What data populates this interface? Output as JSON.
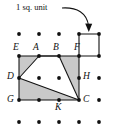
{
  "figure": {
    "title_annotation": "1 sq. unit",
    "background_color": "#ffffff",
    "ink_color": "#111111",
    "shade_color": "#c9c9c9",
    "dot_color": "#111111",
    "grid": {
      "columns": 5,
      "rows": 5,
      "x_positions": [
        19,
        39,
        59,
        79,
        99
      ],
      "y_positions": [
        34,
        56,
        78,
        100,
        122
      ],
      "dot_radius": 1.9
    },
    "unit_square": {
      "label": "1 sq. unit",
      "corners": [
        [
          79,
          34
        ],
        [
          99,
          34
        ],
        [
          99,
          56
        ],
        [
          79,
          56
        ]
      ]
    },
    "arrow": {
      "name": "curved-arrow",
      "path": "M 62 8 C 76 8, 86 14, 88 27",
      "head": "M 88 32 L 84.6 24.6 L 91.4 24.6 Z"
    },
    "outer_region": {
      "name": "shaded-rectangle-EFCG",
      "points": "19,56 79,56 79,100 19,100"
    },
    "inner_region": {
      "name": "white-quadrilateral-DABC",
      "points": "19,78 39,56 59,56 79,100"
    },
    "segments": [
      {
        "name": "segment-E-F",
        "from": "E",
        "to": "F"
      },
      {
        "name": "segment-E-D",
        "from": "E",
        "to": "D"
      },
      {
        "name": "segment-D-G",
        "from": "D",
        "to": "G"
      },
      {
        "name": "segment-G-C",
        "from": "G",
        "to": "C"
      },
      {
        "name": "segment-C-F",
        "from": "C",
        "to": "F"
      },
      {
        "name": "segment-D-A",
        "from": "D",
        "to": "A"
      },
      {
        "name": "segment-A-B",
        "from": "A",
        "to": "B"
      },
      {
        "name": "segment-B-C",
        "from": "B",
        "to": "C"
      },
      {
        "name": "segment-D-C",
        "from": "D",
        "to": "C"
      }
    ],
    "labeled_points": [
      {
        "id": "E",
        "label": "E",
        "x": 19,
        "y": 56,
        "label_x": 13,
        "label_y": 44
      },
      {
        "id": "A",
        "label": "A",
        "x": 39,
        "y": 56,
        "label_x": 33,
        "label_y": 44
      },
      {
        "id": "B",
        "label": "B",
        "x": 59,
        "y": 56,
        "label_x": 54,
        "label_y": 44
      },
      {
        "id": "F",
        "label": "F",
        "x": 79,
        "y": 56,
        "label_x": 74,
        "label_y": 44
      },
      {
        "id": "D",
        "label": "D",
        "x": 19,
        "y": 78,
        "label_x": 8,
        "label_y": 73
      },
      {
        "id": "H",
        "label": "H",
        "x": 79,
        "y": 78,
        "label_x": 83,
        "label_y": 73
      },
      {
        "id": "G",
        "label": "G",
        "x": 19,
        "y": 100,
        "label_x": 8,
        "label_y": 95
      },
      {
        "id": "K",
        "label": "K",
        "x": 59,
        "y": 100,
        "label_x": 55,
        "label_y": 103
      },
      {
        "id": "C",
        "label": "C",
        "x": 79,
        "y": 100,
        "label_x": 83,
        "label_y": 95
      }
    ],
    "plain_dots": [
      [
        19,
        34
      ],
      [
        39,
        34
      ],
      [
        59,
        34
      ],
      [
        99,
        78
      ],
      [
        39,
        78
      ],
      [
        59,
        78
      ],
      [
        39,
        100
      ],
      [
        99,
        100
      ],
      [
        19,
        122
      ],
      [
        39,
        122
      ],
      [
        59,
        122
      ],
      [
        79,
        122
      ],
      [
        99,
        122
      ]
    ],
    "callout_text_position": {
      "x": 16,
      "y": 4
    }
  }
}
